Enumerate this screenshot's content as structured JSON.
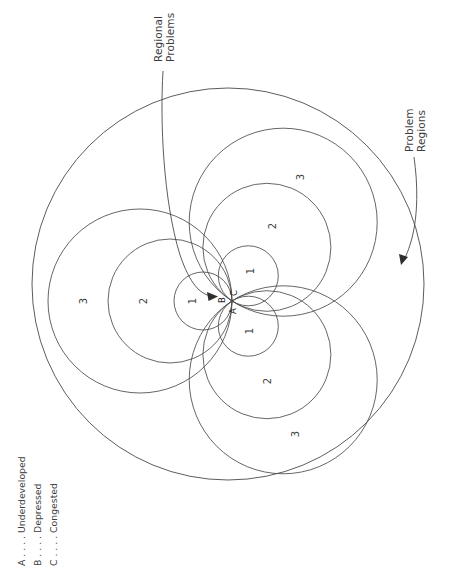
{
  "figure": {
    "title_callouts": [
      {
        "id": "regional-problems",
        "text": "Regional\nProblems"
      },
      {
        "id": "problem-regions",
        "text": "Problem\nRegions"
      }
    ],
    "legend": {
      "rows": [
        {
          "key": "A",
          "sep": " . . . .",
          "label": "Underdeveloped"
        },
        {
          "key": "B",
          "sep": " . . . .",
          "label": "Depressed"
        },
        {
          "key": "C",
          "sep": " . . . .",
          "label": "Congested"
        }
      ]
    },
    "groups": [
      {
        "id": "group-b",
        "letter": "B",
        "direction_deg": 180,
        "rings": [
          {
            "label": "1",
            "radius": 29
          },
          {
            "label": "2",
            "radius": 62
          },
          {
            "label": "3",
            "radius": 92
          }
        ]
      },
      {
        "id": "group-c",
        "letter": "C",
        "direction_deg": 303,
        "rings": [
          {
            "label": "1",
            "radius": 30
          },
          {
            "label": "2",
            "radius": 64
          },
          {
            "label": "3",
            "radius": 94
          }
        ]
      },
      {
        "id": "group-a",
        "letter": "A",
        "direction_deg": 57,
        "rings": [
          {
            "label": "1",
            "radius": 30
          },
          {
            "label": "2",
            "radius": 64
          },
          {
            "label": "3",
            "radius": 94
          }
        ]
      }
    ],
    "outer_boundary": {
      "cx": 228,
      "cy": 284,
      "r": 196
    },
    "tangent_point": {
      "x": 232,
      "y": 301
    },
    "colors": {
      "stroke": "#4a4a4a",
      "text": "#3d3d3d",
      "background": "#ffffff"
    }
  }
}
